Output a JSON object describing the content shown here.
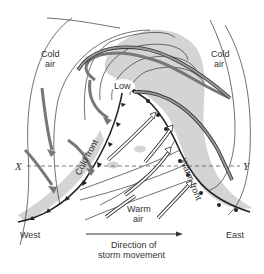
{
  "diagram": {
    "labels": {
      "cold_air_left_line1": "Cold",
      "cold_air_left_line2": "air",
      "cold_air_right_line1": "Cold",
      "cold_air_right_line2": "air",
      "low": "Low",
      "cold_front": "Cold front",
      "warm_front": "Warm front",
      "warm_air_line1": "Warm",
      "warm_air_line2": "air",
      "x_marker": "X",
      "y_marker": "Y",
      "west": "West",
      "east": "East",
      "direction_line1": "Direction of",
      "direction_line2": "storm movement"
    },
    "colors": {
      "line": "#333333",
      "precipitation_shading": "#d4d4d4",
      "cold_air_arrow": "#777777",
      "warm_air_arrow": "#ffffff"
    }
  }
}
